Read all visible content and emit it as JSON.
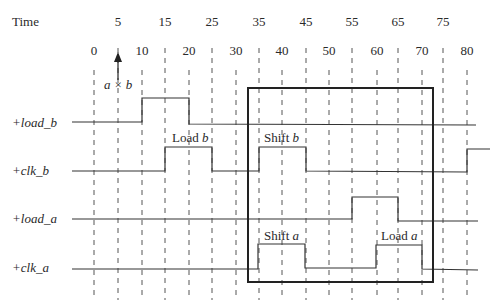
{
  "title_label": "Time",
  "top_ticks": [
    {
      "label": "5",
      "x": 118
    },
    {
      "label": "15",
      "x": 165
    },
    {
      "label": "25",
      "x": 212
    },
    {
      "label": "35",
      "x": 259
    },
    {
      "label": "45",
      "x": 306
    },
    {
      "label": "55",
      "x": 352
    },
    {
      "label": "65",
      "x": 398
    },
    {
      "label": "75",
      "x": 443
    }
  ],
  "bottom_ticks": [
    {
      "label": "0",
      "x": 94
    },
    {
      "label": "10",
      "x": 142
    },
    {
      "label": "20",
      "x": 189
    },
    {
      "label": "30",
      "x": 236
    },
    {
      "label": "40",
      "x": 282
    },
    {
      "label": "50",
      "x": 329
    },
    {
      "label": "60",
      "x": 377
    },
    {
      "label": "70",
      "x": 422
    },
    {
      "label": "80",
      "x": 467
    }
  ],
  "marker": {
    "label": "a × b",
    "time": 5
  },
  "signals": [
    {
      "name": "+load_b",
      "y_low": 122,
      "y_high": 98
    },
    {
      "name": "+clk_b",
      "y_low": 171,
      "y_high": 147
    },
    {
      "name": "+load_a",
      "y_low": 219,
      "y_high": 197
    },
    {
      "name": "+clk_a",
      "y_low": 269,
      "y_high": 244
    }
  ],
  "annotations": [
    {
      "text": "Load b",
      "x": 172,
      "y": 142
    },
    {
      "text": "Shift b",
      "x": 264,
      "y": 142
    },
    {
      "text": "Shift a",
      "x": 264,
      "y": 240
    },
    {
      "text": "Load a",
      "x": 381,
      "y": 240
    }
  ],
  "highlight_box": {
    "x1": 248,
    "y1": 88,
    "x2": 433,
    "y2": 282
  }
}
